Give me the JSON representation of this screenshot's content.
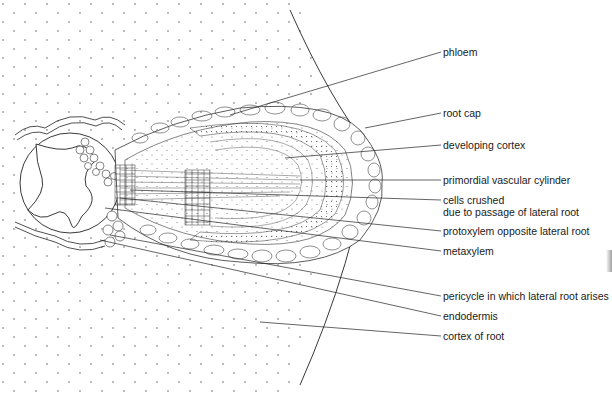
{
  "diagram": {
    "labels": [
      {
        "id": "phloem",
        "text": "phloem",
        "x": 443,
        "y": 46
      },
      {
        "id": "root-cap",
        "text": "root cap",
        "x": 443,
        "y": 107
      },
      {
        "id": "developing-cortex",
        "text": "developing cortex",
        "x": 443,
        "y": 139
      },
      {
        "id": "primordial-vascular-cylinder",
        "text": "primordial vascular cylinder",
        "x": 443,
        "y": 174
      },
      {
        "id": "cells-crushed",
        "text": "cells crushed",
        "x": 443,
        "y": 194
      },
      {
        "id": "cells-crushed-2",
        "text": "due to passage of lateral root",
        "x": 443,
        "y": 206
      },
      {
        "id": "protoxylem",
        "text": "protoxylem opposite lateral root",
        "x": 443,
        "y": 225
      },
      {
        "id": "metaxylem",
        "text": "metaxylem",
        "x": 443,
        "y": 245
      },
      {
        "id": "pericycle",
        "text": "pericycle in which lateral root arises",
        "x": 443,
        "y": 290
      },
      {
        "id": "endodermis",
        "text": "endodermis",
        "x": 443,
        "y": 310
      },
      {
        "id": "cortex-of-root",
        "text": "cortex of root",
        "x": 443,
        "y": 330
      }
    ]
  }
}
